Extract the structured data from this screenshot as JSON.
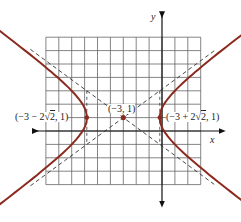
{
  "chart_data": {
    "type": "line",
    "title": "",
    "xlabel": "x",
    "ylabel": "y",
    "equation_form": "hyperbola (x+3)^2/8 - (y-1)^2/4 = 1",
    "grid": true,
    "xlim": [
      -9,
      3
    ],
    "ylim": [
      -4,
      7
    ],
    "center": {
      "x": -3,
      "y": 1,
      "label": "(−3, 1)"
    },
    "vertices": [
      {
        "x": -5.83,
        "y": 1,
        "label_parts": [
          "(−3 − 2",
          "2",
          ", 1)"
        ]
      },
      {
        "x": -0.17,
        "y": 1,
        "label_parts": [
          "(−3 + 2",
          "2",
          ", 1)"
        ]
      }
    ],
    "asymptotes": [
      {
        "style": "dashed",
        "slope": 0.707,
        "through": [
          -3,
          1
        ]
      },
      {
        "style": "dashed",
        "slope": -0.707,
        "through": [
          -3,
          1
        ]
      }
    ],
    "series": [
      {
        "name": "left branch",
        "color": "#8b2a1e"
      },
      {
        "name": "right branch",
        "color": "#8b2a1e"
      }
    ],
    "colors": {
      "curve": "#8b2a1e",
      "grid": "#555555",
      "axis": "#111111",
      "asymptote": "#333333"
    }
  }
}
